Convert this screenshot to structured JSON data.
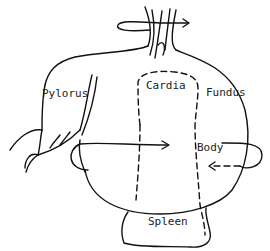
{
  "diagram": {
    "labels": {
      "pylorus": "Pylorus",
      "cardia": "Cardia",
      "fundus": "Fundus",
      "body": "Body",
      "spleen": "Spleen"
    },
    "colors": {
      "line": "#111111",
      "text": "#222222",
      "background": "#ffffff"
    }
  }
}
